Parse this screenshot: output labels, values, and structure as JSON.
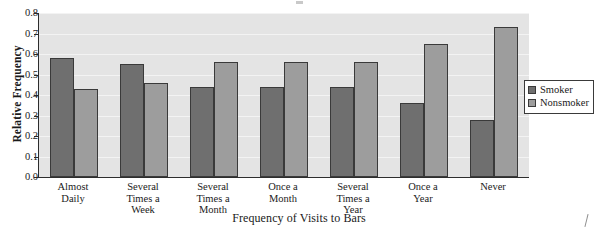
{
  "chart_data": {
    "type": "bar",
    "title": "",
    "xlabel": "Frequency of Visits to Bars",
    "ylabel": "Relative Frequency",
    "ylim": [
      0.0,
      0.8
    ],
    "ytick_labels": [
      "0.0",
      "0.1",
      "0.2",
      "0.3",
      "0.4",
      "0.5",
      "0.6",
      "0.7",
      "0.8"
    ],
    "ytick_values": [
      0.0,
      0.1,
      0.2,
      0.3,
      0.4,
      0.5,
      0.6,
      0.7,
      0.8
    ],
    "grid": true,
    "legend_position": "right",
    "categories": [
      "Almost\nDaily",
      "Several\nTimes a\nWeek",
      "Several\nTimes a\nMonth",
      "Once a\nMonth",
      "Several\nTimes a\nYear",
      "Once a\nYear",
      "Never"
    ],
    "series": [
      {
        "name": "Smoker",
        "color": "#6f6f6f",
        "values": [
          0.58,
          0.55,
          0.44,
          0.44,
          0.44,
          0.36,
          0.28
        ]
      },
      {
        "name": "Nonsmoker",
        "color": "#9d9d9d",
        "values": [
          0.43,
          0.46,
          0.56,
          0.56,
          0.56,
          0.65,
          0.73
        ]
      }
    ]
  },
  "legend": {
    "entries": [
      {
        "label": "Smoker",
        "color": "#6f6f6f"
      },
      {
        "label": "Nonsmoker",
        "color": "#9d9d9d"
      }
    ]
  },
  "colors": {
    "plot_background": "#e4e4e4",
    "gridline": "#f3f3f3",
    "axis": "#2d2d2d",
    "smoker": "#6f6f6f",
    "nonsmoker": "#9d9d9d"
  }
}
